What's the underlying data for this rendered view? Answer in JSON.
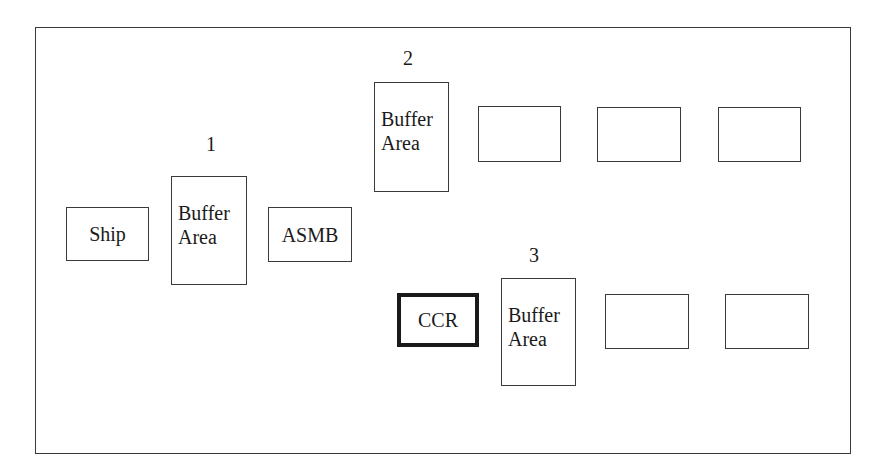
{
  "diagram": {
    "type": "layout-flow",
    "zones": [
      {
        "id": "1",
        "label": "1"
      },
      {
        "id": "2",
        "label": "2"
      },
      {
        "id": "3",
        "label": "3"
      }
    ],
    "nodes": {
      "ship": {
        "label": "Ship"
      },
      "buffer1": {
        "line1": "Buffer",
        "line2": "Area"
      },
      "asmb": {
        "label": "ASMB"
      },
      "buffer2": {
        "line1": "Buffer",
        "line2": "Area"
      },
      "row2_box1": {
        "label": ""
      },
      "row2_box2": {
        "label": ""
      },
      "row2_box3": {
        "label": ""
      },
      "ccr": {
        "label": "CCR",
        "emphasis": "thick-border"
      },
      "buffer3": {
        "line1": "Buffer",
        "line2": "Area"
      },
      "row3_box1": {
        "label": ""
      },
      "row3_box2": {
        "label": ""
      }
    },
    "colors": {
      "stroke": "#3a3a3a",
      "emphasis_stroke": "#1a1a1a",
      "background": "#ffffff"
    }
  }
}
